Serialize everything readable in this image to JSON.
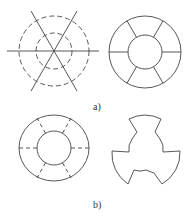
{
  "figure": {
    "panels": [
      {
        "label": "a)",
        "description": "Construction lines (dashed circles with three crossing lines) and resulting ring divided into six segments"
      },
      {
        "label": "b)",
        "description": "Ring with dashed division lines and resulting three-lobed cut shape"
      }
    ]
  },
  "colors": {
    "stroke": "#444444",
    "background": "#ffffff"
  }
}
